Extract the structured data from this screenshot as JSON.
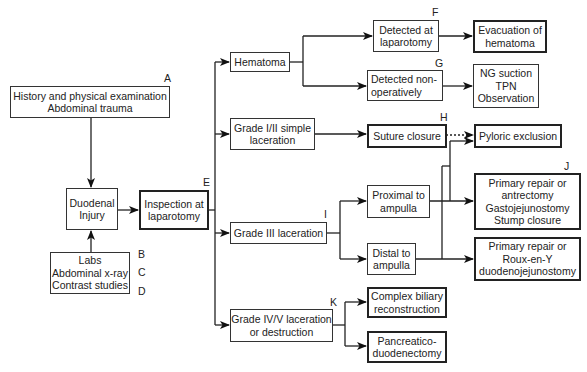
{
  "diagram": {
    "type": "flowchart",
    "nodes": {
      "history": {
        "letter": "A",
        "lines": [
          "History and physical examination",
          "Abdominal trauma"
        ]
      },
      "duodenal_injury": {
        "lines": [
          "Duodenal",
          "Injury"
        ]
      },
      "inspection": {
        "letter": "E",
        "lines": [
          "Inspection at",
          "laparotomy"
        ]
      },
      "labs": {
        "lines": [
          "Labs",
          "Abdominal x-ray",
          "Contrast studies"
        ],
        "letters": [
          "B",
          "C",
          "D"
        ]
      },
      "hematoma": {
        "lines": [
          "Hematoma"
        ]
      },
      "grade_1_2": {
        "lines": [
          "Grade I/II simple",
          "laceration"
        ]
      },
      "grade_3": {
        "letter": "I",
        "lines": [
          "Grade III laceration"
        ]
      },
      "grade_4_5": {
        "letter": "K",
        "lines": [
          "Grade IV/V laceration",
          "or destruction"
        ]
      },
      "detected_laparotomy": {
        "letter": "F",
        "lines": [
          "Detected at",
          "laparotomy"
        ]
      },
      "evacuation": {
        "lines": [
          "Evacuation of",
          "hematoma"
        ]
      },
      "detected_nonop": {
        "letter": "G",
        "lines": [
          "Detected non-",
          "operatively"
        ]
      },
      "ng_suction": {
        "lines": [
          "NG suction",
          "TPN",
          "Observation"
        ]
      },
      "suture_closure": {
        "letter": "H",
        "lines": [
          "Suture closure"
        ]
      },
      "pyloric_exclusion": {
        "lines": [
          "Pyloric exclusion"
        ]
      },
      "proximal": {
        "lines": [
          "Proximal to",
          "ampulla"
        ]
      },
      "distal": {
        "lines": [
          "Distal to",
          "ampulla"
        ]
      },
      "primary_antrectomy": {
        "letter": "J",
        "lines": [
          "Primary repair or",
          "antrectomy",
          "Gastojejunostomy",
          "Stump closure"
        ]
      },
      "primary_roux": {
        "lines": [
          "Primary repair or",
          "Roux-en-Y",
          "duodenojejunostomy"
        ]
      },
      "complex_biliary": {
        "lines": [
          "Complex biliary",
          "reconstruction"
        ]
      },
      "pancreatico": {
        "lines": [
          "Pancreatico-",
          "duodenectomy"
        ]
      }
    },
    "edges": [
      [
        "history",
        "duodenal_injury"
      ],
      [
        "labs",
        "duodenal_injury"
      ],
      [
        "duodenal_injury",
        "inspection"
      ],
      [
        "inspection",
        "hematoma"
      ],
      [
        "inspection",
        "grade_1_2"
      ],
      [
        "inspection",
        "grade_3"
      ],
      [
        "inspection",
        "grade_4_5"
      ],
      [
        "hematoma",
        "detected_laparotomy"
      ],
      [
        "hematoma",
        "detected_nonop"
      ],
      [
        "detected_laparotomy",
        "evacuation"
      ],
      [
        "detected_nonop",
        "ng_suction"
      ],
      [
        "grade_1_2",
        "suture_closure"
      ],
      [
        "suture_closure",
        "pyloric_exclusion",
        "dotted"
      ],
      [
        "grade_3",
        "proximal"
      ],
      [
        "grade_3",
        "distal"
      ],
      [
        "proximal",
        "primary_antrectomy"
      ],
      [
        "proximal",
        "pyloric_exclusion"
      ],
      [
        "distal",
        "primary_roux"
      ],
      [
        "distal",
        "pyloric_exclusion"
      ],
      [
        "grade_4_5",
        "complex_biliary"
      ],
      [
        "grade_4_5",
        "pancreatico"
      ]
    ]
  }
}
